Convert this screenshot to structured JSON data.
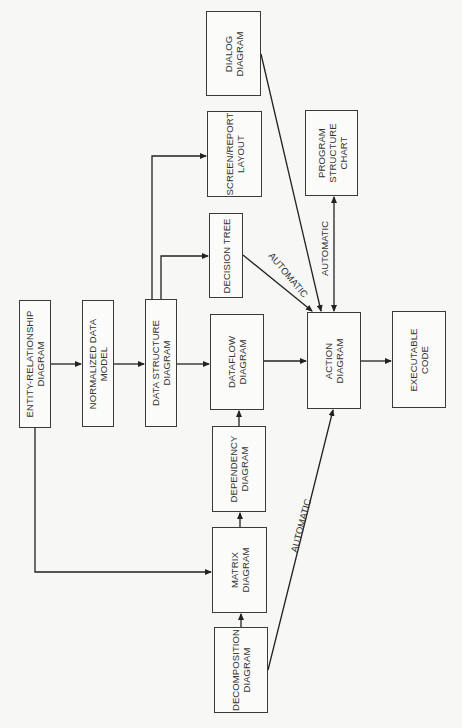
{
  "diagram": {
    "title": "",
    "orientation": "rotated-90-ccw",
    "nodes": [
      {
        "id": "er",
        "lines": [
          "ENTITY-RELATIONSHIP",
          "DIAGRAM"
        ],
        "x": 19,
        "y": 300,
        "w": 32,
        "h": 128
      },
      {
        "id": "ndm",
        "lines": [
          "NORMALIZED DATA",
          "MODEL"
        ],
        "x": 82,
        "y": 300,
        "w": 32,
        "h": 127
      },
      {
        "id": "ds",
        "lines": [
          "DATA STRUCTURE",
          "DIAGRAM"
        ],
        "x": 145,
        "y": 299,
        "w": 32,
        "h": 128
      },
      {
        "id": "dt",
        "lines": [
          "DECISION TREE"
        ],
        "x": 209,
        "y": 213,
        "w": 34,
        "h": 85
      },
      {
        "id": "sr",
        "lines": [
          "SCREEN/REPORT",
          "LAYOUT"
        ],
        "x": 207,
        "y": 111,
        "w": 55,
        "h": 86
      },
      {
        "id": "dlg",
        "lines": [
          "DIALOG",
          "DIAGRAM"
        ],
        "x": 206,
        "y": 11,
        "w": 55,
        "h": 85
      },
      {
        "id": "df",
        "lines": [
          "DATAFLOW",
          "DIAGRAM"
        ],
        "x": 210,
        "y": 314,
        "w": 54,
        "h": 96
      },
      {
        "id": "dep",
        "lines": [
          "DEPENDENCY",
          "DIAGRAM"
        ],
        "x": 212,
        "y": 426,
        "w": 54,
        "h": 86
      },
      {
        "id": "mx",
        "lines": [
          "MATRIX",
          "DIAGRAM"
        ],
        "x": 212,
        "y": 527,
        "w": 55,
        "h": 86
      },
      {
        "id": "dec",
        "lines": [
          "DECOMPOSITION",
          "DIAGRAM"
        ],
        "x": 214,
        "y": 627,
        "w": 54,
        "h": 86
      },
      {
        "id": "act",
        "lines": [
          "ACTION",
          "DIAGRAM"
        ],
        "x": 307,
        "y": 312,
        "w": 54,
        "h": 97
      },
      {
        "id": "exe",
        "lines": [
          "EXECUTABLE",
          "CODE"
        ],
        "x": 392,
        "y": 311,
        "w": 54,
        "h": 97
      },
      {
        "id": "psc",
        "lines": [
          "PROGRAM",
          "STRUCTURE",
          "CHART"
        ],
        "x": 305,
        "y": 110,
        "w": 53,
        "h": 86
      }
    ],
    "edges": [
      {
        "from": "er",
        "to": "ndm",
        "label": ""
      },
      {
        "from": "ndm",
        "to": "ds",
        "label": ""
      },
      {
        "from": "ds",
        "to": "df",
        "label": ""
      },
      {
        "from": "ds",
        "to": "dt",
        "label": ""
      },
      {
        "from": "ds",
        "to": "sr",
        "label": ""
      },
      {
        "from": "er",
        "to": "mx",
        "label": ""
      },
      {
        "from": "dec",
        "to": "mx",
        "label": ""
      },
      {
        "from": "mx",
        "to": "dep",
        "label": ""
      },
      {
        "from": "dep",
        "to": "df",
        "label": ""
      },
      {
        "from": "df",
        "to": "act",
        "label": ""
      },
      {
        "from": "act",
        "to": "exe",
        "label": ""
      },
      {
        "from": "dt",
        "to": "act",
        "label": "AUTOMATIC"
      },
      {
        "from": "dlg",
        "to": "act",
        "label": ""
      },
      {
        "from": "act",
        "to": "psc",
        "label": "AUTOMATIC",
        "bidirectional": true
      },
      {
        "from": "dec",
        "to": "act",
        "label": "AUTOMATIC"
      }
    ],
    "edge_labels": {
      "dt_act": "AUTOMATIC",
      "act_psc": "AUTOMATIC",
      "dec_act": "AUTOMATIC"
    },
    "colors": {
      "line": "#222222",
      "box_border": "#3a3a3a",
      "text": "#333333",
      "background": "#f7f7f5"
    }
  }
}
